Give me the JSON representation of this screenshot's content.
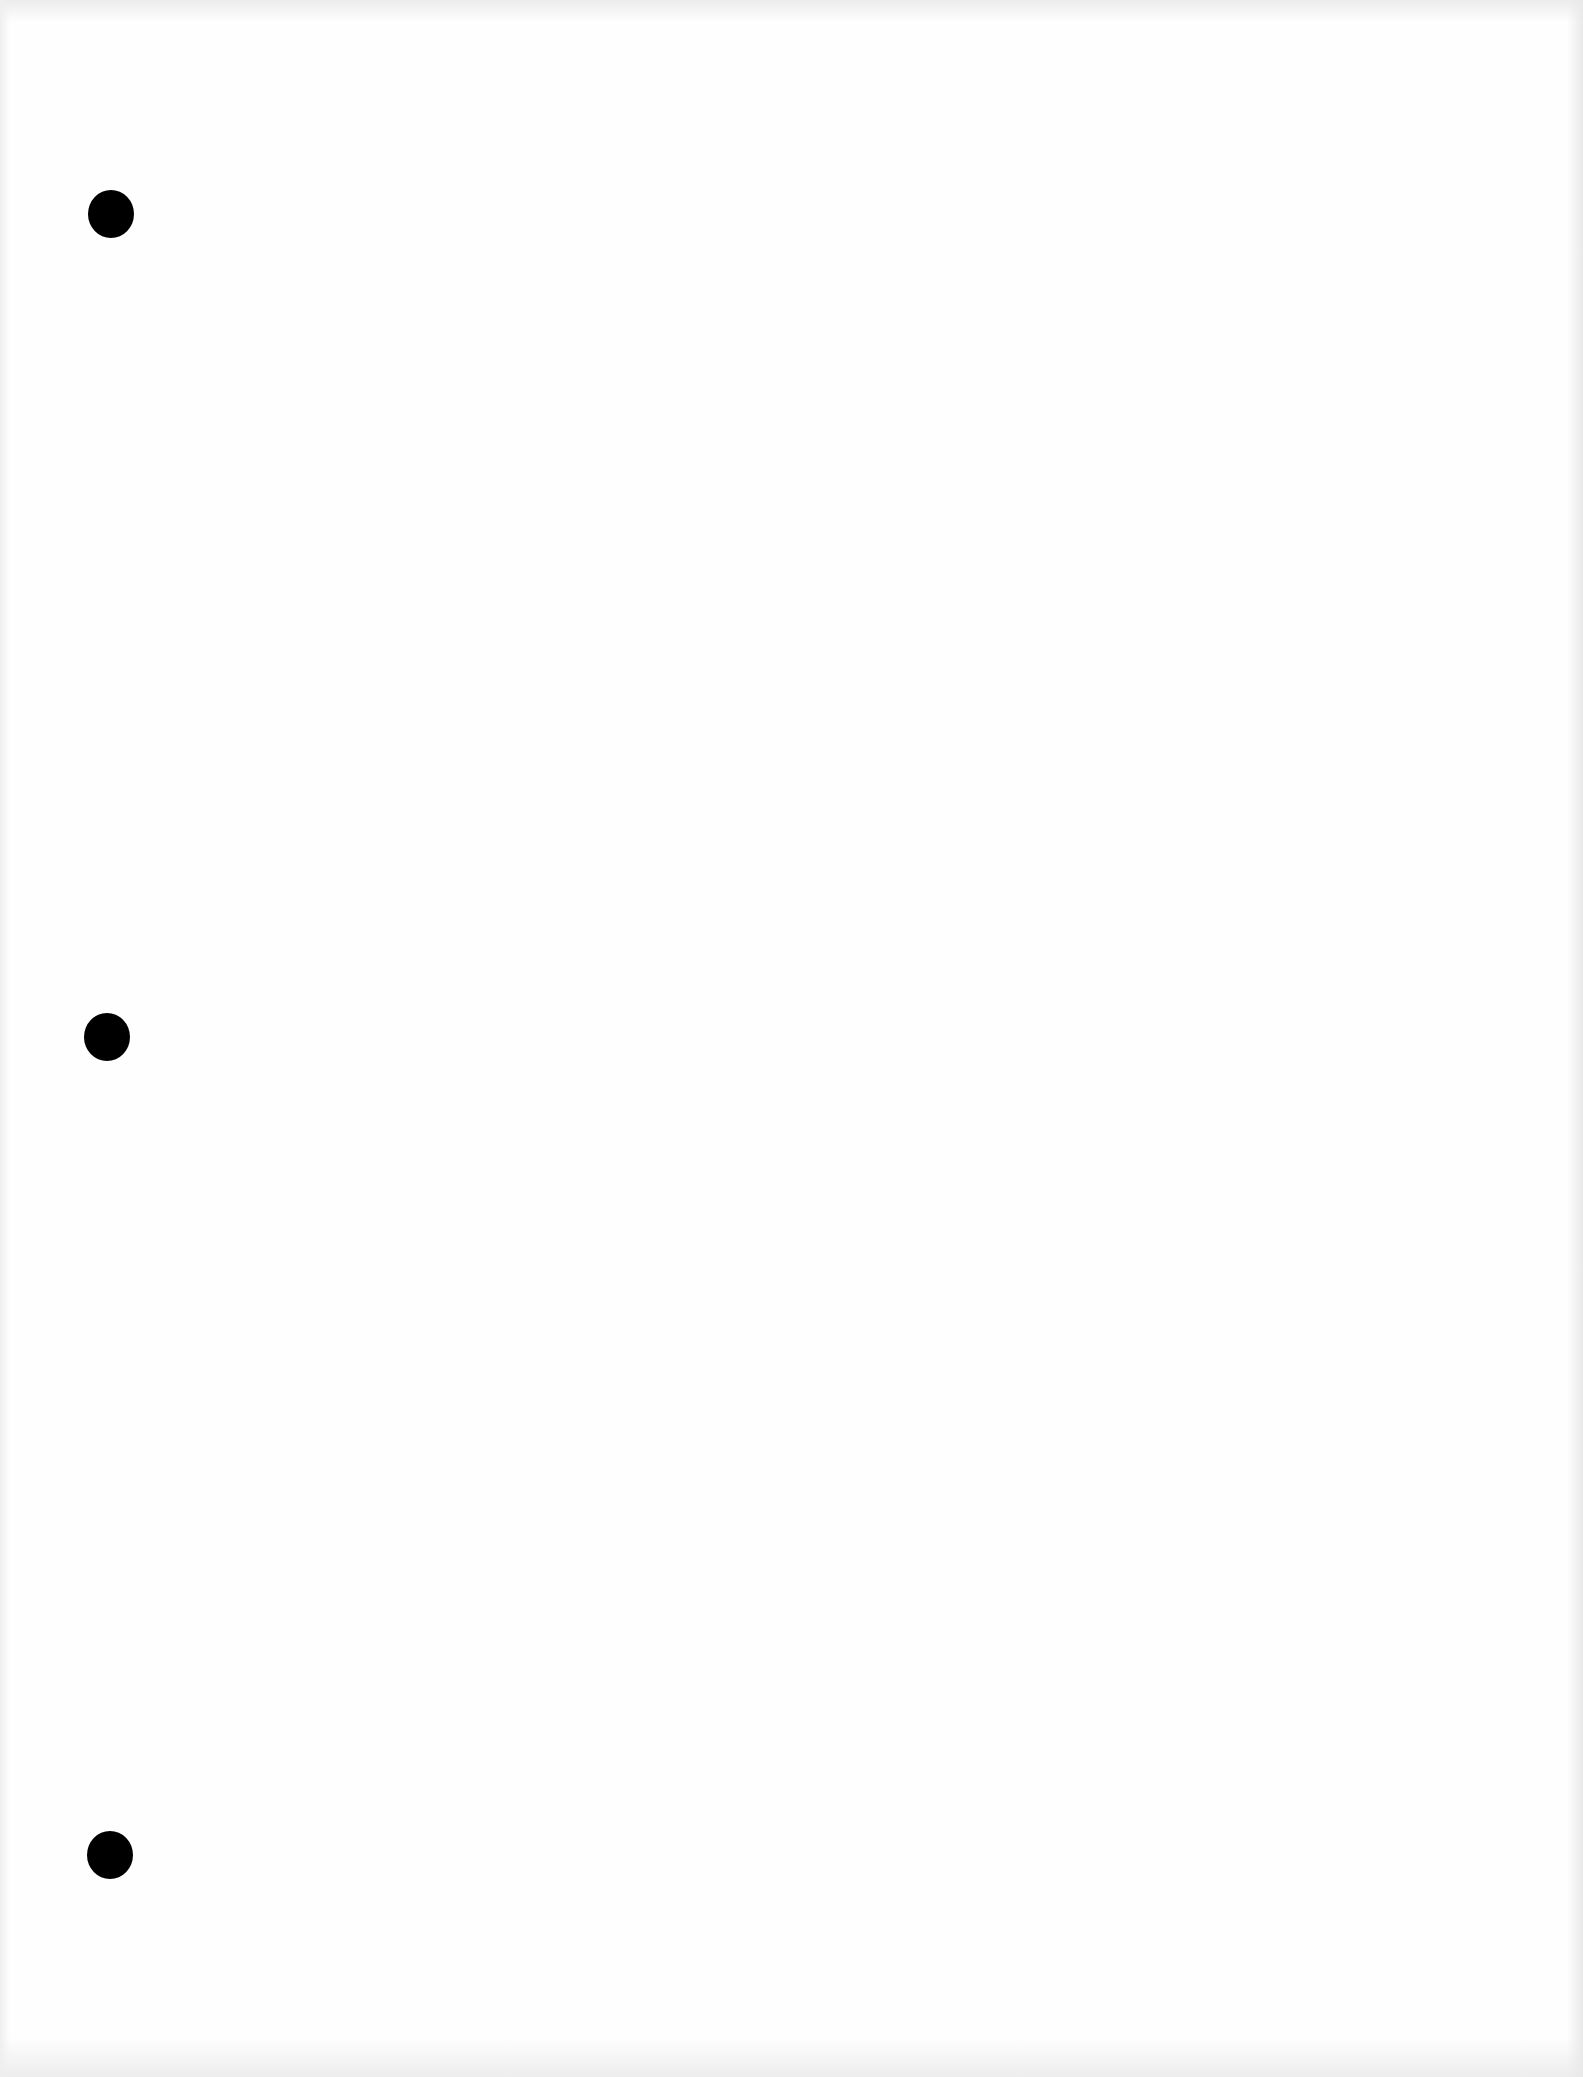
{
  "document": {
    "type": "blank loose-leaf sheet",
    "text": "",
    "paper_color": "#fefefe",
    "hole_color": "#000000",
    "punch_holes": [
      {
        "label": "top",
        "x": 111,
        "y": 214
      },
      {
        "label": "middle",
        "x": 107,
        "y": 1037
      },
      {
        "label": "bottom",
        "x": 110,
        "y": 1855
      }
    ]
  }
}
